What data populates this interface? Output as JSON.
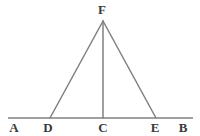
{
  "figure": {
    "background_color": "#ffffff",
    "stroke_color": "#808080",
    "label_color": "#3a3a3a",
    "width": 200,
    "height": 136,
    "baseline": {
      "name": "line-AB",
      "x1": 8,
      "y1": 118,
      "x2": 193,
      "y2": 118
    },
    "segments": [
      {
        "name": "segment-FD",
        "x1": 103,
        "y1": 21,
        "x2": 50,
        "y2": 118
      },
      {
        "name": "segment-FE",
        "x1": 103,
        "y1": 21,
        "x2": 156,
        "y2": 118
      },
      {
        "name": "segment-FC",
        "x1": 103,
        "y1": 21,
        "x2": 103,
        "y2": 118
      }
    ],
    "points": [
      {
        "id": "A",
        "label": "A",
        "x": 14,
        "y": 121
      },
      {
        "id": "D",
        "label": "D",
        "x": 48,
        "y": 121
      },
      {
        "id": "C",
        "label": "C",
        "x": 103,
        "y": 121
      },
      {
        "id": "E",
        "label": "E",
        "x": 155,
        "y": 121
      },
      {
        "id": "B",
        "label": "B",
        "x": 183,
        "y": 121
      },
      {
        "id": "F",
        "label": "F",
        "x": 102,
        "y": 3
      }
    ]
  }
}
